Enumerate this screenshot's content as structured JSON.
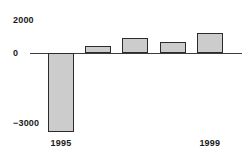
{
  "chart_data": {
    "type": "bar",
    "title": "",
    "subtitle": "",
    "xlabel": "",
    "ylabel": "",
    "categories": [
      "1995",
      "1996",
      "1997",
      "1998",
      "1999"
    ],
    "values": [
      -4800,
      420,
      900,
      670,
      1200
    ],
    "ylim": [
      -4800,
      2000
    ],
    "yticks": [
      2000,
      0,
      -3000
    ],
    "ytick_labels": [
      "2000",
      "0",
      "−3000"
    ],
    "visible_xtick_labels": [
      "1995",
      "1999"
    ],
    "grid": false,
    "legend": null,
    "bar_fill_color": "#cccccc",
    "bar_edge_color": "#2b2b2b",
    "axis_color": "#3c3c3c",
    "background_color": "#ffffff",
    "text_color": "#1a1a1a"
  },
  "axis": {
    "y_top_label": "2000",
    "y_zero_label": "0",
    "y_bottom_label": "−3000"
  },
  "xaxis": {
    "first_label": "1995",
    "last_label": "1999"
  }
}
